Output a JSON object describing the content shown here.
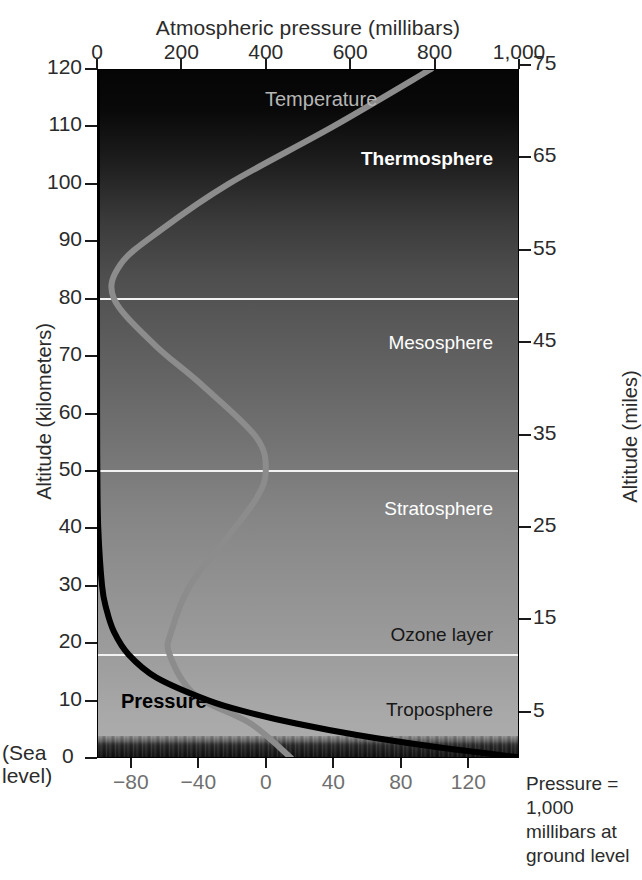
{
  "figure": {
    "top_axis_title": "Atmospheric pressure (millibars)",
    "bottom_axis_title": "Temperature (°C)",
    "left_axis_title": "Altitude (kilometers)",
    "right_axis_title": "Altitude (miles)",
    "sea_level_line1": "(Sea",
    "sea_level_line2": "level)",
    "side_note": "Pressure = 1,000 millibars at ground level"
  },
  "axes": {
    "pressure_ticks": [
      "0",
      "200",
      "400",
      "600",
      "800",
      "1,000"
    ],
    "pressure_values": [
      0,
      200,
      400,
      600,
      800,
      1000
    ],
    "temperature_ticks": [
      "−80",
      "−40",
      "0",
      "40",
      "80",
      "120"
    ],
    "temperature_values": [
      -80,
      -40,
      0,
      40,
      80,
      120
    ],
    "altitude_km_ticks": [
      "120",
      "110",
      "100",
      "90",
      "80",
      "70",
      "60",
      "50",
      "40",
      "30",
      "20",
      "10",
      "0"
    ],
    "altitude_km_values": [
      120,
      110,
      100,
      90,
      80,
      70,
      60,
      50,
      40,
      30,
      20,
      10,
      0
    ],
    "altitude_miles_ticks": [
      "75",
      "65",
      "55",
      "45",
      "35",
      "25",
      "15",
      "5"
    ],
    "altitude_miles_values": [
      75,
      65,
      55,
      45,
      35,
      25,
      15,
      5
    ]
  },
  "layers": [
    {
      "name": "Thermosphere",
      "label_y_km": 104,
      "style": "light bold"
    },
    {
      "name": "Mesosphere",
      "label_y_km": 72,
      "style": "light"
    },
    {
      "name": "Stratosphere",
      "label_y_km": 43,
      "style": "light"
    },
    {
      "name": "Ozone layer",
      "label_y_km": 21,
      "style": "dark"
    },
    {
      "name": "Troposphere",
      "label_y_km": 8,
      "style": "dark"
    }
  ],
  "boundaries_km": [
    80,
    50,
    18
  ],
  "curve_labels": {
    "temperature": "Temperature",
    "pressure": "Pressure"
  },
  "colors": {
    "temperature_curve": "#8c8c8c",
    "pressure_curve": "#000000",
    "boundary_line": "#f2f2f2",
    "background": "#ffffff",
    "axis_text": "#2b2b2b",
    "muted_text": "#6f6f6f"
  },
  "chart_data": {
    "type": "line",
    "title": "Atmospheric pressure (millibars)",
    "xlabel": "Temperature (°C)",
    "ylabel": "Altitude (kilometers)",
    "grid": false,
    "legend": "inline-annotations",
    "x_axis_bottom": {
      "label": "Temperature (°C)",
      "ticks": [
        -80,
        -40,
        0,
        40,
        80,
        120
      ],
      "range": [
        -100,
        150
      ]
    },
    "x_axis_top": {
      "label": "Atmospheric pressure (millibars)",
      "ticks": [
        0,
        200,
        400,
        600,
        800,
        1000
      ],
      "range": [
        0,
        1000
      ]
    },
    "y_axis_left": {
      "label": "Altitude (kilometers)",
      "ticks": [
        0,
        10,
        20,
        30,
        40,
        50,
        60,
        70,
        80,
        90,
        100,
        110,
        120
      ],
      "range": [
        0,
        120
      ]
    },
    "y_axis_right": {
      "label": "Altitude (miles)",
      "ticks": [
        5,
        15,
        25,
        35,
        45,
        55,
        65,
        75
      ],
      "range": [
        0,
        75
      ]
    },
    "series": [
      {
        "name": "Temperature",
        "color": "#8c8c8c",
        "x_unit": "°C",
        "y_unit": "km",
        "points": [
          {
            "altitude_km": 0,
            "temperature_c": 15
          },
          {
            "altitude_km": 6,
            "temperature_c": -9
          },
          {
            "altitude_km": 11,
            "temperature_c": -42
          },
          {
            "altitude_km": 18,
            "temperature_c": -57
          },
          {
            "altitude_km": 22,
            "temperature_c": -56
          },
          {
            "altitude_km": 30,
            "temperature_c": -45
          },
          {
            "altitude_km": 38,
            "temperature_c": -24
          },
          {
            "altitude_km": 45,
            "temperature_c": -6
          },
          {
            "altitude_km": 50,
            "temperature_c": 0
          },
          {
            "altitude_km": 56,
            "temperature_c": -6
          },
          {
            "altitude_km": 65,
            "temperature_c": -38
          },
          {
            "altitude_km": 72,
            "temperature_c": -66
          },
          {
            "altitude_km": 80,
            "temperature_c": -90
          },
          {
            "altitude_km": 86,
            "temperature_c": -86
          },
          {
            "altitude_km": 92,
            "temperature_c": -62
          },
          {
            "altitude_km": 100,
            "temperature_c": -22
          },
          {
            "altitude_km": 110,
            "temperature_c": 40
          },
          {
            "altitude_km": 120,
            "temperature_c": 98
          }
        ]
      },
      {
        "name": "Pressure",
        "color": "#000000",
        "x_unit": "millibars",
        "y_unit": "km",
        "points": [
          {
            "altitude_km": 0,
            "pressure_mb": 1013
          },
          {
            "altitude_km": 2,
            "pressure_mb": 795
          },
          {
            "altitude_km": 4,
            "pressure_mb": 616
          },
          {
            "altitude_km": 6,
            "pressure_mb": 472
          },
          {
            "altitude_km": 8,
            "pressure_mb": 356
          },
          {
            "altitude_km": 10,
            "pressure_mb": 265
          },
          {
            "altitude_km": 14,
            "pressure_mb": 141
          },
          {
            "altitude_km": 18,
            "pressure_mb": 75
          },
          {
            "altitude_km": 22,
            "pressure_mb": 40
          },
          {
            "altitude_km": 26,
            "pressure_mb": 22
          },
          {
            "altitude_km": 30,
            "pressure_mb": 12
          },
          {
            "altitude_km": 40,
            "pressure_mb": 3
          },
          {
            "altitude_km": 50,
            "pressure_mb": 0.8
          },
          {
            "altitude_km": 60,
            "pressure_mb": 0.22
          },
          {
            "altitude_km": 80,
            "pressure_mb": 0.01
          },
          {
            "altitude_km": 100,
            "pressure_mb": 0.0003
          },
          {
            "altitude_km": 120,
            "pressure_mb": 3e-05
          }
        ]
      }
    ],
    "annotations": [
      {
        "text": "Thermosphere",
        "altitude_km": 104
      },
      {
        "text": "Mesosphere",
        "altitude_km": 72
      },
      {
        "text": "Stratosphere",
        "altitude_km": 43
      },
      {
        "text": "Ozone layer",
        "altitude_km": 21
      },
      {
        "text": "Troposphere",
        "altitude_km": 8
      },
      {
        "text": "Temperature",
        "altitude_km": 116
      },
      {
        "text": "Pressure",
        "altitude_km": 10
      },
      {
        "text": "Pressure = 1,000 millibars at ground level",
        "altitude_km": null
      }
    ]
  }
}
